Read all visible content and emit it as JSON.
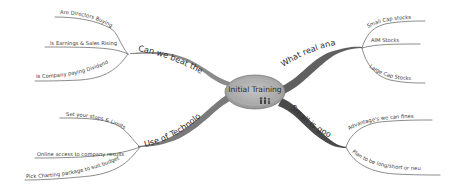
{
  "center": {
    "label": "Initial Training",
    "icon": "people-icon",
    "fill": "#a9a9a9"
  },
  "colors": {
    "branch": "#6a6a6a",
    "branch_dark": "#555555",
    "sub_line": "#7a7a7a",
    "text": "#333333"
  },
  "branches": [
    {
      "id": "beat-pros",
      "label": "Can we beat the pros",
      "children": [
        {
          "label": "Are Directors Buying"
        },
        {
          "label": "Is Earnings & Sales Rising"
        },
        {
          "label": "Is Company paying Dividend"
        }
      ]
    },
    {
      "id": "technology",
      "label": "Use of Technology",
      "children": [
        {
          "label": "Set your stops & Limits"
        },
        {
          "label": "Online access to company results"
        },
        {
          "label": "Pick Charting package to suit budget"
        }
      ]
    },
    {
      "id": "real-analysis",
      "label": "What real analysis",
      "children": [
        {
          "label": "Small Cap stocks"
        },
        {
          "label": "AIM Stocks"
        },
        {
          "label": "Large Cap Stocks"
        }
      ]
    },
    {
      "id": "small-good",
      "label": "Small is good",
      "children": [
        {
          "label": "Advantage's we can finesse"
        },
        {
          "label": "Plan to be long/short or neutral"
        }
      ]
    }
  ]
}
